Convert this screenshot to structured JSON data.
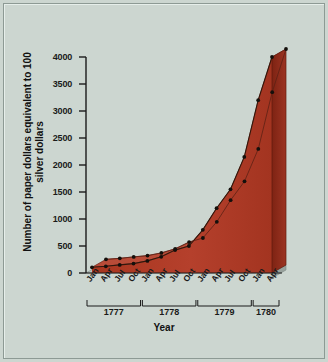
{
  "chart_data": {
    "type": "area",
    "title": "",
    "xlabel": "Year",
    "ylabel": "Number of paper dollars equivalent to 100 silver dollars",
    "ylim": [
      0,
      4000
    ],
    "yticks": [
      0,
      500,
      1000,
      1500,
      2000,
      2500,
      3000,
      3500,
      4000
    ],
    "ytick_labels": [
      "0",
      "500",
      "1000",
      "1500",
      "2000",
      "2500",
      "3000",
      "3500",
      "4000"
    ],
    "categories": [
      "Jan",
      "Apr",
      "Jul",
      "Oct",
      "Jan",
      "Apr",
      "Jul",
      "Oct",
      "Jan",
      "Apr",
      "Jul",
      "Oct",
      "Jan",
      "Apr"
    ],
    "values": [
      105,
      125,
      150,
      175,
      225,
      300,
      425,
      500,
      800,
      1200,
      1550,
      2150,
      3200,
      4000
    ],
    "year_groups": [
      {
        "label": "1777",
        "start_index": 0,
        "end_index": 3
      },
      {
        "label": "1778",
        "start_index": 4,
        "end_index": 7
      },
      {
        "label": "1779",
        "start_index": 8,
        "end_index": 11
      },
      {
        "label": "1780",
        "start_index": 12,
        "end_index": 13
      }
    ],
    "grid": false,
    "legend": "none",
    "marker": "filled-circle",
    "colors": {
      "area_fill": "#b23a29",
      "area_top_face": "#c4604d",
      "area_side": "#8c2a1d",
      "line": "#2a1208",
      "marker": "#15100c",
      "axis": "#1a1a1a",
      "background": "#ccd6d0",
      "border": "#8d9a94"
    }
  }
}
